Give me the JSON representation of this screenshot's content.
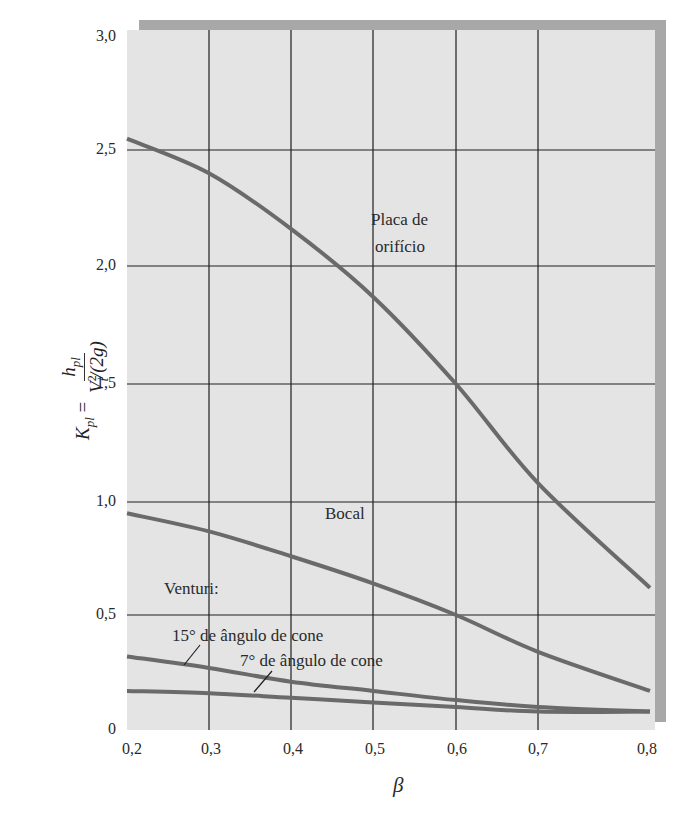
{
  "chart_data": {
    "type": "line",
    "title": "",
    "xlabel": "β",
    "ylabel": "K_pl = h_pl / (V_t^2/(2g))",
    "xlim": [
      0.2,
      0.8
    ],
    "ylim": [
      0,
      3.0
    ],
    "grid": true,
    "x_ticks": [
      "0,2",
      "0,3",
      "0,4",
      "0,5",
      "0,6",
      "0,7",
      "0,8"
    ],
    "y_ticks": [
      "0",
      "0,5",
      "1,0",
      "1,5",
      "2,0",
      "2,5",
      "3,0"
    ],
    "x": [
      0.2,
      0.3,
      0.4,
      0.5,
      0.6,
      0.7,
      0.8
    ],
    "series": [
      {
        "name": "Placa de orifício",
        "values": [
          2.55,
          2.4,
          2.16,
          1.87,
          1.5,
          1.08,
          0.62
        ]
      },
      {
        "name": "Bocal",
        "values": [
          0.95,
          0.87,
          0.76,
          0.64,
          0.5,
          0.34,
          0.17
        ]
      },
      {
        "name": "Venturi: 15° de ângulo de cone",
        "values": [
          0.32,
          0.27,
          0.21,
          0.17,
          0.13,
          0.1,
          0.08
        ]
      },
      {
        "name": "Venturi: 7° de ângulo de cone",
        "values": [
          0.17,
          0.16,
          0.14,
          0.12,
          0.1,
          0.08,
          0.08
        ]
      }
    ],
    "annotations": [
      "Placa de orifício",
      "Bocal",
      "Venturi:",
      "15° de ângulo de cone",
      "7° de ângulo de cone"
    ]
  },
  "labels": {
    "placa_line1": "Placa de",
    "placa_line2": "orifício",
    "bocal": "Bocal",
    "venturi": "Venturi:",
    "cone15": "15° de ângulo de cone",
    "cone7": "7° de ângulo de cone",
    "xlabel": "β",
    "ylabel_lhs": "K",
    "ylabel_lhs_sub": "pl",
    "ylabel_num": "h",
    "ylabel_num_sub": "pl",
    "ylabel_den": "V",
    "ylabel_den_sup": "2",
    "ylabel_den_sub": "t",
    "ylabel_den_rest": "/(2g)"
  },
  "colors": {
    "plot_bg": "#e4e4e4",
    "frame_shadow": "#a8a8a8",
    "grid": "#1e1e1e",
    "curve": "#6a6a6a"
  }
}
